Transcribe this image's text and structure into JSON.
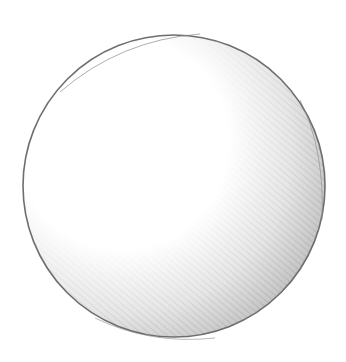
{
  "image": {
    "subject": "Pencil sketch of a shaded sphere",
    "background_color": "#ffffff",
    "outline_color": "#6e6e6e",
    "shadow_color": "#9a9a9a",
    "highlight_position": "upper-left",
    "shadow_position": "lower-right",
    "shading_style": "diagonal hatching",
    "sphere": {
      "cx": 174,
      "cy": 186,
      "r": 152
    }
  }
}
